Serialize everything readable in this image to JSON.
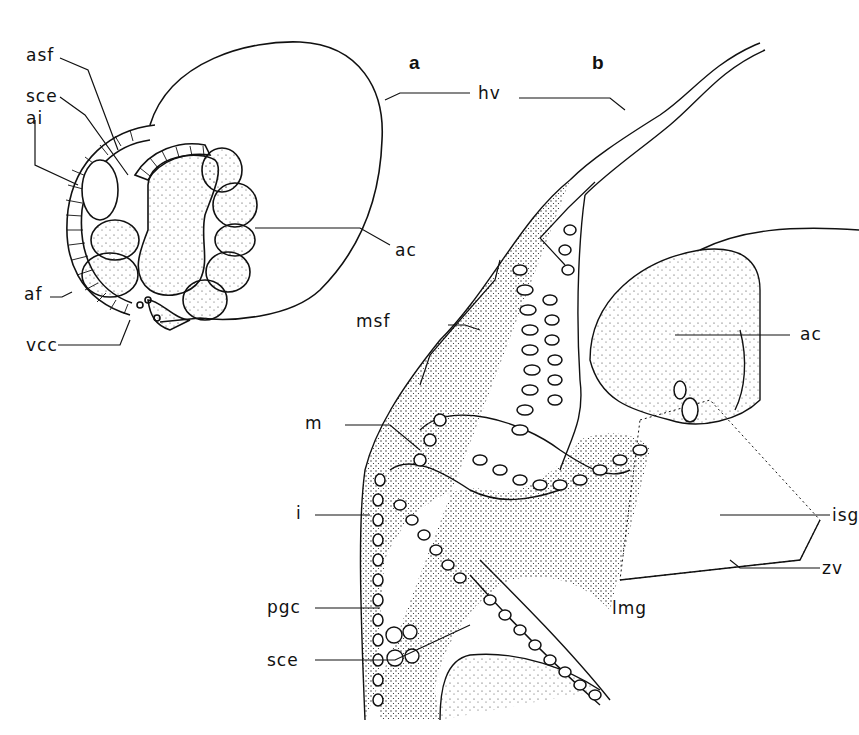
{
  "figure": {
    "panels": [
      {
        "id": "a",
        "label": "a"
      },
      {
        "id": "b",
        "label": "b"
      }
    ],
    "labels_a": {
      "asf": "asf",
      "sce": "sce",
      "ai": "ai",
      "af": "af",
      "vcc": "vcc",
      "ac": "ac",
      "hv": "hv"
    },
    "labels_b": {
      "msf": "msf",
      "ac": "ac",
      "m": "m",
      "i": "i",
      "isg": "isg",
      "zv": "zv",
      "pgc": "pgc",
      "lmg": "lmg",
      "sce": "sce"
    }
  }
}
